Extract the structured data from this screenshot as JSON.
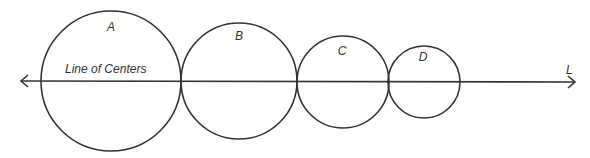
{
  "diagram": {
    "line": {
      "label": "L",
      "caption": "Line of Centers",
      "y": 81,
      "x1": 20,
      "x2": 576
    },
    "circles": [
      {
        "label": "A",
        "cx": 111,
        "cy": 81,
        "r": 70,
        "lx": 111,
        "ly": 27
      },
      {
        "label": "B",
        "cx": 239,
        "cy": 81,
        "r": 58,
        "lx": 239,
        "ly": 40
      },
      {
        "label": "C",
        "cx": 343,
        "cy": 82,
        "r": 46,
        "lx": 342,
        "ly": 55
      },
      {
        "label": "D",
        "cx": 424,
        "cy": 82,
        "r": 36,
        "lx": 423,
        "ly": 61
      }
    ],
    "stroke_color": "#333333"
  }
}
